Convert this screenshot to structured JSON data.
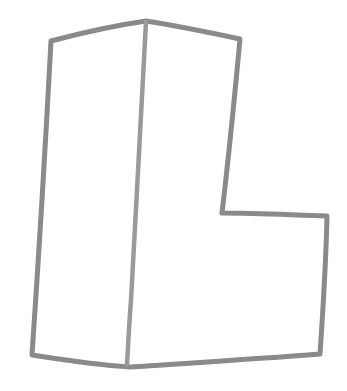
{
  "canvas": {
    "width": 347,
    "height": 391,
    "background_color": "#ffffff",
    "title": "hand-drawn L-shaped polygon sketch"
  },
  "style": {
    "stroke_color": "#8a8a8a",
    "stroke_color_light": "#9a9a9a",
    "stroke_width": 5,
    "divider_stroke_width": 4.5,
    "fill": "none",
    "linecap": "round",
    "linejoin": "round"
  },
  "drawing": {
    "shape_name": "L-shape outline with interior vertical divider",
    "outline_path": "M 51 41 C 85 32, 118 25, 146 21 C 178 26, 212 33, 240 39 C 236 82, 230 146, 222 213 C 256 213, 292 215, 327 216 C 326 262, 323 310, 320 354 C 256 359, 190 363, 130 367 C 98 365, 64 360, 32 355 C 37 282, 43 192, 51 41 Z",
    "divider_path": "M 146 22 C 142 100, 136 208, 131 300 C 129 325, 128 348, 127 365",
    "vertices": [
      {
        "name": "top-left-corner",
        "x": 51,
        "y": 41
      },
      {
        "name": "top-apex",
        "x": 146,
        "y": 21
      },
      {
        "name": "top-right-corner",
        "x": 240,
        "y": 39
      },
      {
        "name": "notch-inner-corner",
        "x": 222,
        "y": 213
      },
      {
        "name": "notch-right-corner",
        "x": 327,
        "y": 216
      },
      {
        "name": "bottom-right-corner",
        "x": 320,
        "y": 354
      },
      {
        "name": "bottom-dip",
        "x": 130,
        "y": 367
      },
      {
        "name": "bottom-left-corner",
        "x": 32,
        "y": 355
      }
    ],
    "segments": [
      {
        "name": "top-left-edge",
        "from": "top-left-corner",
        "to": "top-apex"
      },
      {
        "name": "top-right-edge",
        "from": "top-apex",
        "to": "top-right-corner"
      },
      {
        "name": "right-upper-edge",
        "from": "top-right-corner",
        "to": "notch-inner-corner"
      },
      {
        "name": "notch-horizontal-edge",
        "from": "notch-inner-corner",
        "to": "notch-right-corner"
      },
      {
        "name": "right-lower-edge",
        "from": "notch-right-corner",
        "to": "bottom-right-corner"
      },
      {
        "name": "bottom-right-edge",
        "from": "bottom-right-corner",
        "to": "bottom-dip"
      },
      {
        "name": "bottom-left-edge",
        "from": "bottom-dip",
        "to": "bottom-left-corner"
      },
      {
        "name": "left-edge",
        "from": "bottom-left-corner",
        "to": "top-left-corner"
      },
      {
        "name": "interior-divider",
        "from": "top-apex",
        "to": "bottom-dip"
      }
    ]
  }
}
